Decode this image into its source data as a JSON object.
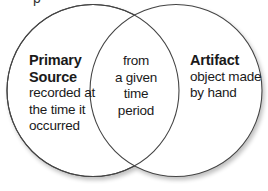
{
  "diagram": {
    "type": "venn",
    "top_fragment": "p",
    "sets": [
      {
        "id": "left",
        "title_lines": [
          "Primary",
          "Source"
        ],
        "description_lines": [
          "recorded at",
          "the time it",
          "occurred"
        ]
      },
      {
        "id": "right",
        "title_lines": [
          "Artifact"
        ],
        "description_lines": [
          "object made",
          "by hand"
        ]
      }
    ],
    "intersection": {
      "lines": [
        "from",
        "a given",
        "time",
        "period"
      ]
    },
    "colors": {
      "stroke": "#444444",
      "fill": "#ffffff",
      "text": "#1a1a1a"
    }
  }
}
